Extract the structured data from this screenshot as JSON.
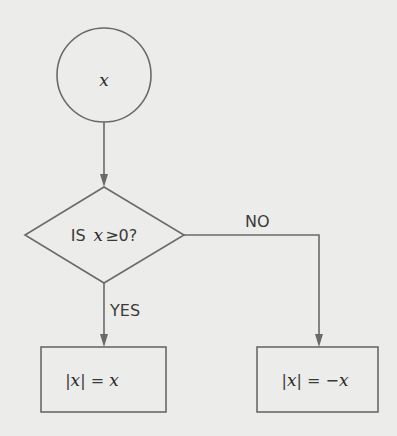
{
  "flowchart": {
    "start": {
      "label": "x"
    },
    "decision": {
      "prefix": "IS",
      "var": "x",
      "rest": "≥0?"
    },
    "branches": {
      "yes": "YES",
      "no": "NO"
    },
    "yes_box": {
      "pre": "|",
      "var1": "x",
      "mid": "| = ",
      "var2": "x"
    },
    "no_box": {
      "pre": "|",
      "var1": "x",
      "mid": "| = −",
      "var2": "x"
    }
  }
}
